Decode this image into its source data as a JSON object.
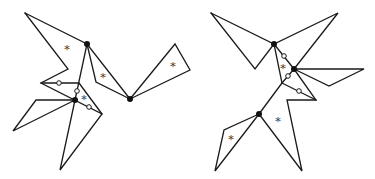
{
  "diagram": {
    "colors": {
      "stroke": "#1a1a1a",
      "filled_vertex": "#111111",
      "open_vertex_fill": "#ffffff",
      "asterisk": "#333333"
    },
    "figures": [
      {
        "name": "left-figure",
        "polylines": [
          [
            [
              25,
              13
            ],
            [
              87,
              44
            ],
            [
              130,
              99
            ]
          ],
          [
            [
              25,
              13
            ],
            [
              68,
              69
            ],
            [
              41,
              83
            ],
            [
              102,
              114
            ],
            [
              60,
              170
            ],
            [
              75,
              100
            ]
          ],
          [
            [
              87,
              44
            ],
            [
              75,
              100
            ]
          ],
          [
            [
              87,
              44
            ],
            [
              96,
              82
            ],
            [
              130,
              99
            ]
          ],
          [
            [
              41,
              83
            ],
            [
              79,
              83
            ],
            [
              102,
              114
            ]
          ],
          [
            [
              75,
              100
            ],
            [
              36,
              100
            ],
            [
              13,
              131
            ],
            [
              75,
              100
            ]
          ],
          [
            [
              130,
              99
            ],
            [
              175,
              44
            ],
            [
              190,
              70
            ],
            [
              130,
              99
            ]
          ]
        ],
        "filled_vertices": [
          [
            87,
            44
          ],
          [
            75,
            100
          ],
          [
            130,
            99
          ]
        ],
        "open_vertices": [
          [
            59,
            83
          ],
          [
            77,
            91
          ],
          [
            89,
            107
          ]
        ],
        "asterisks": [
          {
            "x": 67,
            "y": 48,
            "label": "*"
          },
          {
            "x": 103,
            "y": 76,
            "label": "*"
          },
          {
            "x": 84,
            "y": 98,
            "label": "*"
          },
          {
            "x": 173,
            "y": 65,
            "label": "*"
          }
        ]
      },
      {
        "name": "right-figure",
        "polylines": [
          [
            [
              211,
              13
            ],
            [
              274,
              44
            ],
            [
              338,
              13
            ],
            [
              294,
              69
            ]
          ],
          [
            [
              211,
              13
            ],
            [
              255,
              69
            ],
            [
              274,
              44
            ]
          ],
          [
            [
              274,
              44
            ],
            [
              294,
              69
            ],
            [
              316,
              100
            ],
            [
              287,
              100
            ],
            [
              302,
              171
            ],
            [
              259,
              114
            ]
          ],
          [
            [
              274,
              44
            ],
            [
              282,
              83
            ],
            [
              259,
              114
            ],
            [
              215,
              171
            ],
            [
              224,
              130
            ],
            [
              259,
              114
            ]
          ],
          [
            [
              282,
              83
            ],
            [
              294,
              69
            ]
          ],
          [
            [
              282,
              83
            ],
            [
              316,
              100
            ]
          ],
          [
            [
              294,
              69
            ],
            [
              364,
              69
            ],
            [
              329,
              86
            ],
            [
              294,
              69
            ]
          ]
        ],
        "filled_vertices": [
          [
            274,
            44
          ],
          [
            294,
            69
          ],
          [
            259,
            114
          ]
        ],
        "open_vertices": [
          [
            284,
            56
          ],
          [
            288,
            76
          ],
          [
            299,
            91
          ]
        ],
        "asterisks": [
          {
            "x": 283,
            "y": 67,
            "label": "*"
          },
          {
            "x": 278,
            "y": 120,
            "label": "*"
          },
          {
            "x": 231,
            "y": 138,
            "label": "*"
          }
        ]
      }
    ]
  }
}
